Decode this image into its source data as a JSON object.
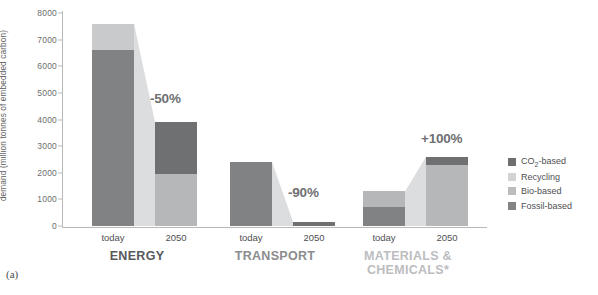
{
  "panel_label": "(a)",
  "chart_data": {
    "type": "bar",
    "subtype": "stacked-bar-with-flow-ribbons",
    "title": "",
    "xlabel": "",
    "ylabel": "demand (million tonnes of embedded carbon)",
    "ylim": [
      0,
      8000
    ],
    "yticks": [
      0,
      1000,
      2000,
      3000,
      4000,
      5000,
      6000,
      7000,
      8000
    ],
    "ytick_labels": [
      "0",
      "1000",
      "2000",
      "3000",
      "4000",
      "5000",
      "6000",
      "7000",
      "8000"
    ],
    "grid": false,
    "legend_position": "right",
    "categories": [
      "today",
      "2050"
    ],
    "series": [
      {
        "name": "CO2-based",
        "color": "#6d6e70"
      },
      {
        "name": "Recycling",
        "color": "#cfd0d2"
      },
      {
        "name": "Bio-based",
        "color": "#b4b5b7"
      },
      {
        "name": "Fossil-based",
        "color": "#808183"
      }
    ],
    "groups": [
      {
        "name": "ENERGY",
        "label": "ENERGY",
        "label_color": "#58595b",
        "change_label": "-50%",
        "bars": [
          {
            "category": "today",
            "total": 7600,
            "segments": [
              {
                "series": "Fossil-based",
                "value": 6600,
                "color": "#818284"
              },
              {
                "series": "Recycling",
                "value": 1000,
                "color": "#c9cacc"
              }
            ]
          },
          {
            "category": "2050",
            "total": 3900,
            "segments": [
              {
                "series": "Bio-based",
                "value": 1950,
                "color": "#b6b7b9"
              },
              {
                "series": "CO2-based",
                "value": 1950,
                "color": "#6f7072"
              }
            ]
          }
        ]
      },
      {
        "name": "TRANSPORT",
        "label": "TRANSPORT",
        "label_color": "#8b8c8e",
        "change_label": "-90%",
        "bars": [
          {
            "category": "today",
            "total": 2400,
            "segments": [
              {
                "series": "Fossil-based",
                "value": 2400,
                "color": "#818284"
              }
            ]
          },
          {
            "category": "2050",
            "total": 160,
            "segments": [
              {
                "series": "CO2-based",
                "value": 160,
                "color": "#6f7072"
              }
            ]
          }
        ]
      },
      {
        "name": "MATERIALS & CHEMICALS",
        "label": "MATERIALS &\nCHEMICALS*",
        "label_line1": "MATERIALS &",
        "label_line2": "CHEMICALS*",
        "label_color": "#bcbdbf",
        "change_label": "+100%",
        "bars": [
          {
            "category": "today",
            "total": 1300,
            "segments": [
              {
                "series": "Fossil-based",
                "value": 700,
                "color": "#818284"
              },
              {
                "series": "Recycling",
                "value": 600,
                "color": "#b6b7b9"
              }
            ]
          },
          {
            "category": "2050",
            "total": 2600,
            "segments": [
              {
                "series": "Bio-based",
                "value": 2300,
                "color": "#b6b7b9"
              },
              {
                "series": "CO2-based",
                "value": 300,
                "color": "#6f7072"
              }
            ]
          }
        ]
      }
    ]
  },
  "legend": {
    "items": [
      {
        "label": "CO2-based",
        "label_html": "CO<sub>2</sub>-based",
        "color": "#6d6e70"
      },
      {
        "label": "Recycling",
        "color": "#d2d3d5"
      },
      {
        "label": "Bio-based",
        "color": "#bcbdbf"
      },
      {
        "label": "Fossil-based",
        "color": "#828385"
      }
    ]
  },
  "axis_labels": {
    "today": "today",
    "2050": "2050"
  }
}
